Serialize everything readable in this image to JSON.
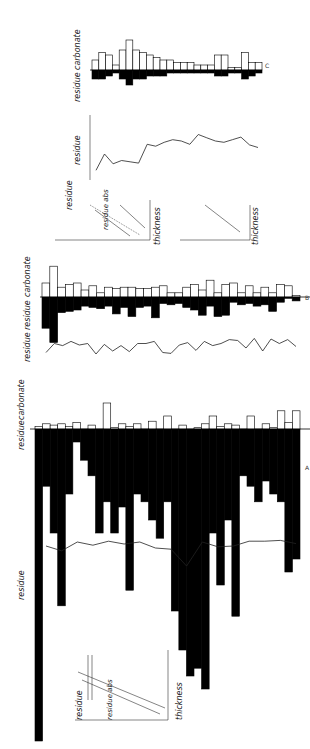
{
  "figure": {
    "orientation": "rotated 90° (columns run left-to-right on page)",
    "panels": [
      {
        "id": "A",
        "label": "A"
      },
      {
        "id": "B",
        "label": "B"
      },
      {
        "id": "C",
        "label": "C"
      }
    ],
    "labels": {
      "carbonate": "carbonate",
      "residue": "residue",
      "residue_abs": "residue abs",
      "thickness": "thickness",
      "pct": "%",
      "mm": "mm",
      "cm": "cm"
    },
    "ticks": {
      "carbonate_scale": [
        "10",
        "20cm"
      ],
      "residue_scale": [
        "10",
        "20"
      ],
      "residue_pct": [
        "20",
        "40",
        "60",
        "80"
      ]
    }
  },
  "chart_data": [
    {
      "type": "bar",
      "title": "Panel C – carbonate / residue bed thickness",
      "xlabel": "bed sequence",
      "series": [
        {
          "name": "carbonate (cm)",
          "values": [
            4,
            7,
            6,
            2,
            8,
            12,
            8,
            7,
            6,
            5,
            4,
            4,
            3,
            3,
            3,
            2,
            2,
            2,
            6,
            6,
            1,
            1,
            7,
            3,
            3
          ]
        },
        {
          "name": "residue (mm)",
          "values": [
            3,
            3,
            2,
            1,
            3,
            5,
            3,
            3,
            2,
            2,
            2,
            1,
            1,
            1,
            1,
            1,
            1,
            1,
            2,
            2,
            1,
            1,
            3,
            2,
            1
          ]
        }
      ]
    },
    {
      "type": "line",
      "title": "Panel C – residue %",
      "ylabel": "residue %",
      "values": [
        15,
        40,
        25,
        30,
        28,
        26,
        55,
        52,
        58,
        62,
        60,
        55,
        70,
        65,
        60,
        58,
        62,
        66,
        54,
        50
      ]
    },
    {
      "type": "bar",
      "title": "Panel B – carbonate / residue bed thickness",
      "series": [
        {
          "name": "carbonate (cm)",
          "values": [
            10,
            22,
            7,
            9,
            10,
            5,
            8,
            3,
            7,
            6,
            7,
            7,
            6,
            6,
            7,
            8,
            3,
            3,
            7,
            9,
            5,
            12,
            3,
            9,
            10,
            3,
            8,
            3,
            7,
            3,
            9,
            8,
            1
          ]
        },
        {
          "name": "residue (mm)",
          "values": [
            24,
            35,
            12,
            11,
            10,
            7,
            8,
            9,
            7,
            13,
            8,
            15,
            8,
            7,
            16,
            5,
            6,
            5,
            8,
            10,
            14,
            7,
            15,
            14,
            4,
            6,
            5,
            7,
            6,
            11,
            4,
            1,
            3
          ]
        }
      ]
    },
    {
      "type": "line",
      "title": "Panel B – residue %",
      "ylabel": "residue %",
      "values": [
        25,
        55,
        48,
        62,
        50,
        55,
        20,
        52,
        30,
        48,
        28,
        55,
        55,
        62,
        25,
        22,
        50,
        58,
        32,
        62,
        48,
        55,
        68,
        65,
        40,
        72,
        30,
        70,
        55,
        68,
        45
      ]
    },
    {
      "type": "bar",
      "title": "Panel A – carbonate / residue bed thickness",
      "series": [
        {
          "name": "carbonate (cm)",
          "values": [
            2,
            4,
            3,
            4,
            2,
            5,
            0,
            3,
            0,
            20,
            1,
            4,
            2,
            4,
            0,
            6,
            0,
            10,
            0,
            3,
            0,
            1,
            4,
            10,
            2,
            4,
            3,
            0,
            10,
            0,
            4,
            1,
            14,
            5,
            14
          ]
        },
        {
          "name": "residue (mm)",
          "values": [
            120,
            22,
            40,
            68,
            25,
            5,
            12,
            18,
            40,
            28,
            40,
            30,
            62,
            25,
            28,
            35,
            42,
            28,
            70,
            85,
            95,
            92,
            100,
            40,
            60,
            35,
            72,
            18,
            22,
            28,
            20,
            25,
            28,
            55,
            50
          ]
        }
      ]
    },
    {
      "type": "line",
      "title": "Panel A – residue %",
      "ylabel": "residue %",
      "values": [
        60,
        48,
        70,
        62,
        72,
        65,
        70,
        55,
        52,
        10,
        70,
        58,
        60,
        72,
        72,
        74,
        66
      ]
    },
    {
      "type": "scatter",
      "title": "Insets – residue vs thickness",
      "xlabel": "thickness (cm)",
      "ylabel": "residue (%) / residue abs (mm)"
    }
  ]
}
